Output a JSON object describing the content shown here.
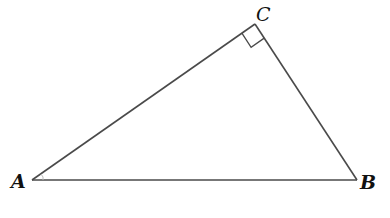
{
  "diagram": {
    "type": "right-triangle",
    "vertices": {
      "A": {
        "label": "A",
        "x": 32,
        "y": 180
      },
      "B": {
        "label": "B",
        "x": 357,
        "y": 180
      },
      "C": {
        "label": "C",
        "x": 255,
        "y": 24
      }
    },
    "right_angle_at": "C",
    "stroke_color": "#4a4a4a",
    "label_color": "#111111",
    "background": "#ffffff"
  }
}
